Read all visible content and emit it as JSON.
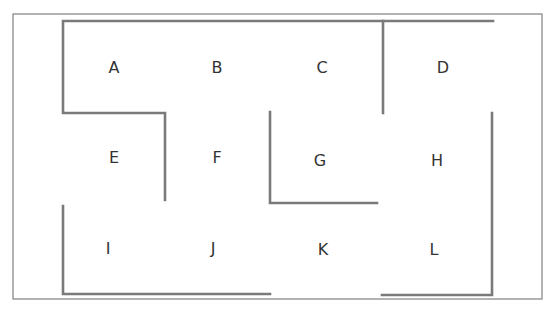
{
  "diagram": {
    "type": "maze-floor-plan",
    "colors": {
      "background": "#ffffff",
      "frame": "#8a8a8a",
      "wall": "#7a7a7a",
      "label": "#333333"
    },
    "frame": {
      "x": 13,
      "y": 14,
      "width": 529,
      "height": 285
    },
    "rooms": [
      {
        "id": "A",
        "label": "A",
        "x": 114,
        "y": 73
      },
      {
        "id": "B",
        "label": "B",
        "x": 217,
        "y": 73
      },
      {
        "id": "C",
        "label": "C",
        "x": 322,
        "y": 73
      },
      {
        "id": "D",
        "label": "D",
        "x": 443,
        "y": 73
      },
      {
        "id": "E",
        "label": "E",
        "x": 114,
        "y": 163
      },
      {
        "id": "F",
        "label": "F",
        "x": 217,
        "y": 163
      },
      {
        "id": "G",
        "label": "G",
        "x": 320,
        "y": 166
      },
      {
        "id": "H",
        "label": "H",
        "x": 437,
        "y": 166
      },
      {
        "id": "I",
        "label": "I",
        "x": 108,
        "y": 254
      },
      {
        "id": "J",
        "label": "J",
        "x": 213,
        "y": 254
      },
      {
        "id": "K",
        "label": "K",
        "x": 323,
        "y": 255
      },
      {
        "id": "L",
        "label": "L",
        "x": 434,
        "y": 255
      }
    ],
    "walls": [
      {
        "name": "top-wall",
        "points": "493,21 63,21 63,113 165,113 165,200"
      },
      {
        "name": "cd-divider-wall",
        "points": "383,21 383,113"
      },
      {
        "name": "g-corner-wall",
        "points": "270,112 270,203 377,203"
      },
      {
        "name": "bottom-left-wall",
        "points": "63,206 63,294 270,294"
      },
      {
        "name": "right-wall",
        "points": "492,113 492,295 382,295"
      }
    ]
  }
}
